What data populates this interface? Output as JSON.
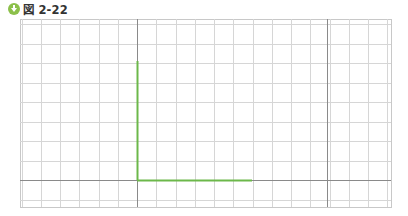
{
  "figure": {
    "title": "図 2-22",
    "icon": "download-circle-icon",
    "accent_color": "#8cc04a"
  },
  "grid": {
    "left": 20,
    "top": 19,
    "right": 391,
    "bottom": 207,
    "origin_x": 137,
    "origin_y": 180,
    "spacing_x": 19.25,
    "spacing_y": 19.5,
    "grid_color": "#d6d6d6",
    "axis_color": "#8a8a8a",
    "extra_dark_x": 327
  },
  "shape": {
    "color": "#6cb84a",
    "vertical_segment": {
      "x": 137,
      "y1": 61,
      "y2": 180
    },
    "horizontal_segment": {
      "y": 180,
      "x1": 137,
      "x2": 252
    }
  }
}
